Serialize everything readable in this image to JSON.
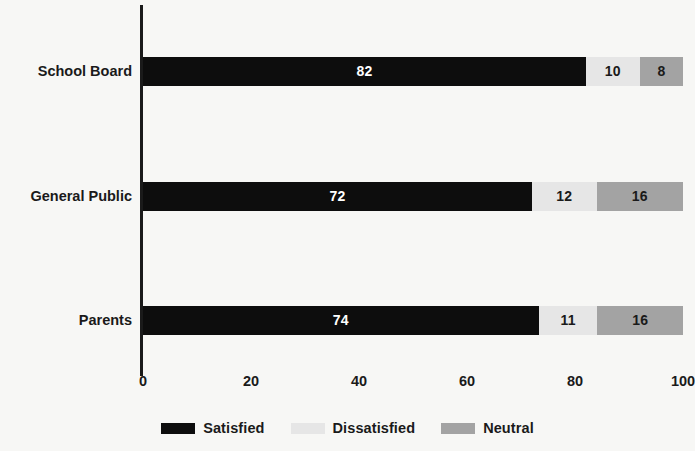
{
  "chart_data": {
    "type": "bar",
    "orientation": "horizontal",
    "stacked": true,
    "title": "",
    "subtitle": "",
    "xlabel": "",
    "ylabel": "",
    "xlim": [
      0,
      100
    ],
    "xticks": [
      "0",
      "20",
      "40",
      "60",
      "80",
      "100"
    ],
    "xtick_values": [
      0,
      20,
      40,
      60,
      80,
      100
    ],
    "grid": false,
    "legend_position": "bottom-center",
    "categories": [
      "School Board",
      "General Public",
      "Parents"
    ],
    "series": [
      {
        "name": "Satisfied",
        "color": "#0d0d0d",
        "values": [
          82,
          72,
          74
        ]
      },
      {
        "name": "Dissatisfied",
        "color": "#e6e6e6",
        "values": [
          10,
          12,
          11
        ]
      },
      {
        "name": "Neutral",
        "color": "#a3a3a3",
        "values": [
          8,
          16,
          16
        ]
      }
    ],
    "rows": [
      {
        "category": "School Board",
        "segments": [
          {
            "series": "Satisfied",
            "value": 82,
            "label": "82",
            "color": "#0d0d0d",
            "label_color": "light"
          },
          {
            "series": "Dissatisfied",
            "value": 10,
            "label": "10",
            "color": "#e6e6e6",
            "label_color": "dark"
          },
          {
            "series": "Neutral",
            "value": 8,
            "label": "8",
            "color": "#a3a3a3",
            "label_color": "dark"
          }
        ]
      },
      {
        "category": "General Public",
        "segments": [
          {
            "series": "Satisfied",
            "value": 72,
            "label": "72",
            "color": "#0d0d0d",
            "label_color": "light"
          },
          {
            "series": "Dissatisfied",
            "value": 12,
            "label": "12",
            "color": "#e6e6e6",
            "label_color": "dark"
          },
          {
            "series": "Neutral",
            "value": 16,
            "label": "16",
            "color": "#a3a3a3",
            "label_color": "dark"
          }
        ]
      },
      {
        "category": "Parents",
        "segments": [
          {
            "series": "Satisfied",
            "value": 74,
            "label": "74",
            "color": "#0d0d0d",
            "label_color": "light"
          },
          {
            "series": "Dissatisfied",
            "value": 11,
            "label": "11",
            "color": "#e6e6e6",
            "label_color": "dark"
          },
          {
            "series": "Neutral",
            "value": 16,
            "label": "16",
            "color": "#a3a3a3",
            "label_color": "dark"
          }
        ]
      }
    ]
  },
  "colors": {
    "background": "#f7f7f5",
    "axis": "#1a1a1a",
    "text": "#1a1a1a",
    "satisfied": "#0d0d0d",
    "dissatisfied": "#e6e6e6",
    "neutral": "#a3a3a3"
  },
  "layout": {
    "plot_left": 143,
    "plot_top": 5,
    "plot_width": 540,
    "plot_height": 363,
    "bar_height": 29,
    "row_centers": [
      71,
      196,
      320
    ]
  }
}
